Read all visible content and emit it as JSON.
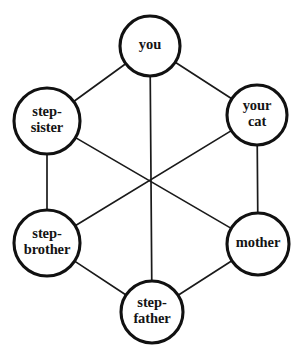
{
  "diagram": {
    "type": "node-link-graph",
    "background_color": "#ffffff",
    "node_fill": "#ffffff",
    "node_stroke": "#111111",
    "edge_stroke": "#1a1a1a",
    "nodes": [
      {
        "id": "you",
        "label": "you",
        "lines": [
          "you"
        ],
        "cx": 150,
        "cy": 46,
        "r": 30
      },
      {
        "id": "your-cat",
        "label": "your cat",
        "lines": [
          "your",
          "cat"
        ],
        "cx": 257,
        "cy": 115,
        "r": 30
      },
      {
        "id": "mother",
        "label": "mother",
        "lines": [
          "mother"
        ],
        "cx": 258,
        "cy": 244,
        "r": 31
      },
      {
        "id": "step-father",
        "label": "step-father",
        "lines": [
          "step-",
          "father"
        ],
        "cx": 152,
        "cy": 312,
        "r": 31
      },
      {
        "id": "step-brother",
        "label": "step-brother",
        "lines": [
          "step-",
          "brother"
        ],
        "cx": 47,
        "cy": 243,
        "r": 33
      },
      {
        "id": "step-sister",
        "label": "step-sister",
        "lines": [
          "step-",
          "sister"
        ],
        "cx": 47,
        "cy": 121,
        "r": 33
      }
    ],
    "edges": [
      {
        "id": "you--your-cat",
        "from": "you",
        "to": "your-cat"
      },
      {
        "id": "your-cat--mother",
        "from": "your-cat",
        "to": "mother"
      },
      {
        "id": "mother--step-father",
        "from": "mother",
        "to": "step-father"
      },
      {
        "id": "step-father--step-brother",
        "from": "step-father",
        "to": "step-brother"
      },
      {
        "id": "step-brother--step-sister",
        "from": "step-brother",
        "to": "step-sister"
      },
      {
        "id": "step-sister--you",
        "from": "step-sister",
        "to": "you"
      },
      {
        "id": "you--step-father",
        "from": "you",
        "to": "step-father"
      },
      {
        "id": "step-sister--mother",
        "from": "step-sister",
        "to": "mother"
      },
      {
        "id": "your-cat--step-brother",
        "from": "your-cat",
        "to": "step-brother"
      }
    ]
  }
}
